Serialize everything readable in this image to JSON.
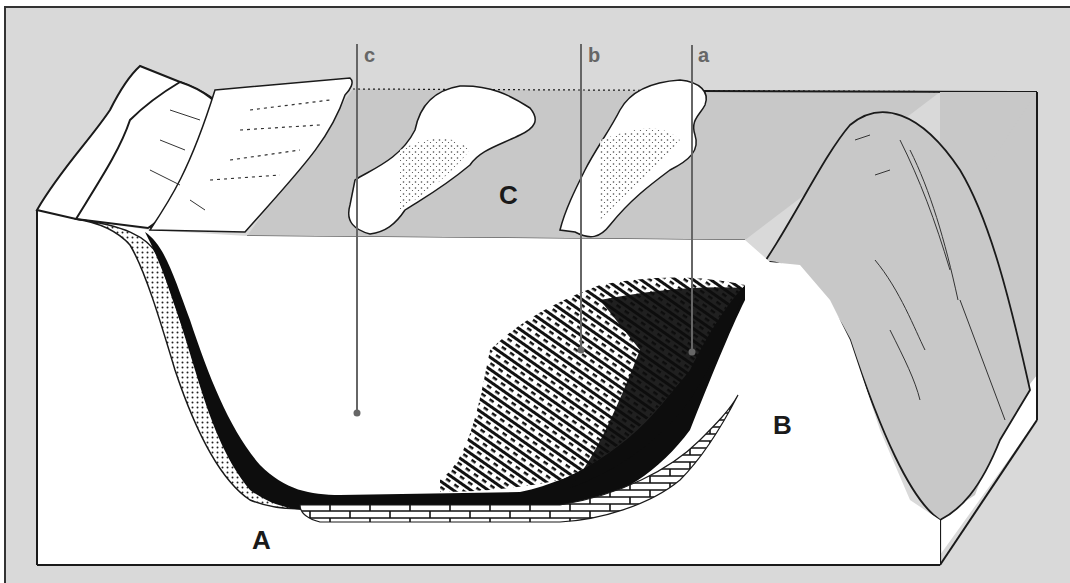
{
  "diagram": {
    "type": "geological block diagram",
    "labels": {
      "region_A": "A",
      "region_B": "B",
      "region_C": "C",
      "leader_a": "a",
      "leader_b": "b",
      "leader_c": "c"
    },
    "regions": [
      {
        "id": "A",
        "description": "basin floor / left slope bottom"
      },
      {
        "id": "B",
        "description": "right ridge cross-section"
      },
      {
        "id": "C",
        "description": "lake surface plane"
      }
    ],
    "leaders": [
      {
        "id": "a",
        "points_to": "dark organic-rich sediment layer"
      },
      {
        "id": "b",
        "points_to": "hatched sediment layer"
      },
      {
        "id": "c",
        "points_to": "water body"
      }
    ],
    "layers": [
      "stippled sand layer (left slope)",
      "black sediment layer",
      "hatched vegetation/peat layer",
      "brick-pattern bedrock"
    ],
    "colors": {
      "background": "#d9d9d9",
      "plane": "#c8c8c8",
      "ink": "#1a1a1a",
      "leader": "#666666",
      "section": "#ffffff"
    }
  }
}
